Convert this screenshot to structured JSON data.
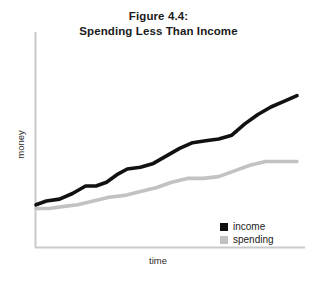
{
  "figure": {
    "title_line1": "Figure 4.4:",
    "title_line2": "Spending Less Than Income",
    "background_color": "#ffffff",
    "axis_color": "#c9c9c9"
  },
  "axes": {
    "y_label": "money",
    "x_label": "time"
  },
  "legend": {
    "position": "bottom-right",
    "items": [
      {
        "label": "income",
        "color": "#111111"
      },
      {
        "label": "spending",
        "color": "#c2c2c2"
      }
    ]
  },
  "chart_data": {
    "type": "line",
    "title": "Figure 4.4: Spending Less Than Income",
    "xlabel": "time",
    "ylabel": "money",
    "xlim": [
      0,
      100
    ],
    "ylim": [
      0,
      100
    ],
    "grid": false,
    "xticks": [],
    "yticks": [],
    "legend_position": "bottom-right",
    "annotations": [],
    "series": [
      {
        "name": "income",
        "color": "#111111",
        "line_width": 3.6,
        "x": [
          0,
          4,
          9,
          14,
          19,
          23,
          27,
          31,
          35,
          40,
          45,
          50,
          55,
          60,
          65,
          70,
          75,
          80,
          85,
          90,
          95,
          100
        ],
        "y": [
          23,
          25,
          26,
          29,
          33,
          33,
          35,
          39,
          42,
          43,
          45,
          49,
          53,
          56,
          57,
          58,
          60,
          66,
          71,
          75,
          78,
          81
        ]
      },
      {
        "name": "spending",
        "color": "#c2c2c2",
        "line_width": 3.6,
        "x": [
          0,
          5,
          10,
          16,
          22,
          28,
          34,
          40,
          46,
          52,
          58,
          64,
          70,
          76,
          82,
          88,
          94,
          100
        ],
        "y": [
          21,
          21,
          22,
          23,
          25,
          27,
          28,
          30,
          32,
          35,
          37,
          37,
          38,
          41,
          44,
          46,
          46,
          46
        ]
      }
    ]
  }
}
